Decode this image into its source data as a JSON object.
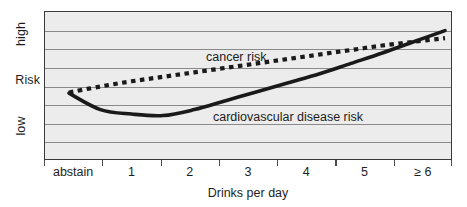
{
  "chart_data": {
    "type": "line",
    "title": "",
    "xlabel": "Drinks per day",
    "ylabel": "Risk",
    "grid": true,
    "legend_position": "inline-annotations",
    "x_tick_labels": [
      "abstain",
      "1",
      "2",
      "3",
      "4",
      "5",
      "≥ 6"
    ],
    "y_tick_labels": [
      "high",
      "Risk",
      "low"
    ],
    "ylim_labels": {
      "low": "low",
      "mid": "Risk",
      "high": "high"
    },
    "y_gridline_count": 7,
    "x": [
      0,
      0.5,
      1,
      1.5,
      2,
      2.5,
      3,
      3.5,
      4,
      4.5,
      5,
      5.5,
      6
    ],
    "series": [
      {
        "name": "cancer risk",
        "style": "dotted",
        "color": "#1a1a1a",
        "annotation": "cancer risk",
        "values": [
          0.46,
          0.5,
          0.535,
          0.565,
          0.595,
          0.625,
          0.655,
          0.685,
          0.715,
          0.745,
          0.775,
          0.8,
          0.825
        ]
      },
      {
        "name": "cardiovascular disease risk",
        "style": "solid",
        "color": "#1a1a1a",
        "annotation": "cardiovascular disease risk",
        "values": [
          0.455,
          0.345,
          0.315,
          0.305,
          0.345,
          0.405,
          0.465,
          0.525,
          0.585,
          0.655,
          0.725,
          0.8,
          0.875
        ]
      }
    ]
  },
  "axes": {
    "y_labels": {
      "high": "high",
      "risk": "Risk",
      "low": "low"
    },
    "x_labels": [
      "abstain",
      "1",
      "2",
      "3",
      "4",
      "5",
      "≥ 6"
    ],
    "x_title": "Drinks per day"
  },
  "annotations": {
    "cancer": "cancer risk",
    "cardiovascular": "cardiovascular disease risk"
  },
  "colors": {
    "plot_background": "#ececec",
    "gridline": "#8a8a8a",
    "frame": "#3a3a3a",
    "series": "#1a1a1a",
    "text": "#1d1d1d",
    "page_background": "#ffffff"
  }
}
